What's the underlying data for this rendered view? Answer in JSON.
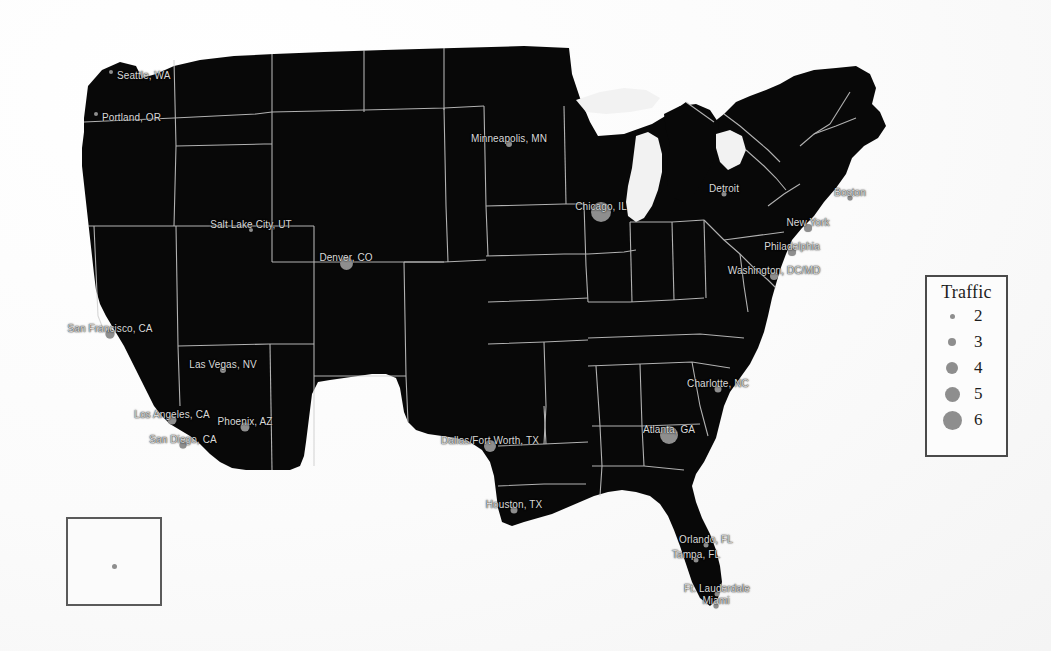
{
  "map": {
    "title": "US Traffic by Metropolitan Area",
    "land_color": "#080808",
    "border_color": "#cfcfcf",
    "marker_color": "#8e8e8e",
    "label_color": "#d9d9d9",
    "background_color": "#fdfdfd",
    "cities": [
      {
        "name": "Seattle, WA",
        "label": "Seattle, WA",
        "x": 87,
        "y": 46,
        "traffic": 2,
        "size": 4,
        "label_pos": "right"
      },
      {
        "name": "Portland, OR",
        "label": "Portland, OR",
        "x": 72,
        "y": 88,
        "traffic": 2,
        "size": 4,
        "label_pos": "right"
      },
      {
        "name": "Salt Lake City, UT",
        "label": "Salt Lake City, UT",
        "x": 227,
        "y": 204,
        "traffic": 2,
        "size": 4,
        "label_pos": "above"
      },
      {
        "name": "Denver, CO",
        "label": "Denver, CO",
        "x": 322,
        "y": 237,
        "traffic": 4.5,
        "size": 13,
        "label_pos": "above"
      },
      {
        "name": "Minneapolis, MN",
        "label": "Minneapolis, MN",
        "x": 485,
        "y": 118,
        "traffic": 2.5,
        "size": 6,
        "label_pos": "above"
      },
      {
        "name": "Chicago, IL",
        "label": "Chicago, IL",
        "x": 577,
        "y": 186,
        "traffic": 6,
        "size": 20,
        "label_pos": "above"
      },
      {
        "name": "Detroit, MI",
        "label": "Detroit",
        "x": 700,
        "y": 168,
        "traffic": 2,
        "size": 5,
        "label_pos": "above"
      },
      {
        "name": "Boston, MA",
        "label": "Boston",
        "x": 826,
        "y": 172,
        "traffic": 2,
        "size": 5,
        "label_pos": "above"
      },
      {
        "name": "New York, NY",
        "label": "New York",
        "x": 784,
        "y": 202,
        "traffic": 3,
        "size": 8,
        "label_pos": "above"
      },
      {
        "name": "Philadelphia, PA",
        "label": "Philadelphia",
        "x": 768,
        "y": 226,
        "traffic": 3,
        "size": 8,
        "label_pos": "above"
      },
      {
        "name": "Washington, DC/MD",
        "label": "Washington, DC/MD",
        "x": 750,
        "y": 250,
        "traffic": 3,
        "size": 8,
        "label_pos": "above"
      },
      {
        "name": "Charlotte, NC",
        "label": "Charlotte, NC",
        "x": 694,
        "y": 363,
        "traffic": 2.5,
        "size": 7,
        "label_pos": "above"
      },
      {
        "name": "Atlanta, GA",
        "label": "Atlanta, GA",
        "x": 645,
        "y": 409,
        "traffic": 5.5,
        "size": 18,
        "label_pos": "above"
      },
      {
        "name": "Orlando, FL",
        "label": "Orlando, FL",
        "x": 682,
        "y": 519,
        "traffic": 2,
        "size": 5,
        "label_pos": "above"
      },
      {
        "name": "Tampa, FL",
        "label": "Tampa, FL",
        "x": 672,
        "y": 534,
        "traffic": 2,
        "size": 5,
        "label_pos": "above"
      },
      {
        "name": "Fort Lauderdale, FL",
        "label": "Ft. Lauderdale",
        "x": 693,
        "y": 568,
        "traffic": 2,
        "size": 5,
        "label_pos": "above"
      },
      {
        "name": "Miami, FL",
        "label": "Miami",
        "x": 692,
        "y": 580,
        "traffic": 2,
        "size": 5,
        "label_pos": "above"
      },
      {
        "name": "Houston, TX",
        "label": "Houston, TX",
        "x": 490,
        "y": 484,
        "traffic": 2.5,
        "size": 7,
        "label_pos": "above"
      },
      {
        "name": "Dallas/Fort Worth, TX",
        "label": "Dallas/Fort Worth, TX",
        "x": 466,
        "y": 420,
        "traffic": 4,
        "size": 12,
        "label_pos": "above"
      },
      {
        "name": "Phoenix, AZ",
        "label": "Phoenix, AZ",
        "x": 221,
        "y": 401,
        "traffic": 3,
        "size": 9,
        "label_pos": "above"
      },
      {
        "name": "Las Vegas, NV",
        "label": "Las Vegas, NV",
        "x": 199,
        "y": 344,
        "traffic": 2.5,
        "size": 6,
        "label_pos": "above"
      },
      {
        "name": "Los Angeles, CA",
        "label": "Los Angeles, CA",
        "x": 148,
        "y": 394,
        "traffic": 3,
        "size": 9,
        "label_pos": "above"
      },
      {
        "name": "San Diego, CA",
        "label": "San Diego, CA",
        "x": 159,
        "y": 419,
        "traffic": 2.5,
        "size": 7,
        "label_pos": "above"
      },
      {
        "name": "San Francisco, CA",
        "label": "San Francisco, CA",
        "x": 86,
        "y": 308,
        "traffic": 3,
        "size": 9,
        "label_pos": "above"
      }
    ]
  },
  "inset": {
    "name": "inset-panel",
    "dot_traffic": 2
  },
  "legend": {
    "title": "Traffic",
    "entries": [
      {
        "value": "2",
        "size": 5
      },
      {
        "value": "3",
        "size": 8
      },
      {
        "value": "4",
        "size": 12
      },
      {
        "value": "5",
        "size": 15
      },
      {
        "value": "6",
        "size": 19
      }
    ]
  }
}
